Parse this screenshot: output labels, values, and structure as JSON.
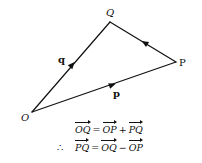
{
  "diagram": {
    "points": {
      "O": {
        "label": "O",
        "x": 32,
        "y": 112
      },
      "Q": {
        "label": "Q",
        "x": 110,
        "y": 22
      },
      "P": {
        "label": "P",
        "x": 176,
        "y": 62
      }
    },
    "vectors": [
      {
        "from": "O",
        "to": "Q",
        "label": "q"
      },
      {
        "from": "O",
        "to": "P",
        "label": "p"
      },
      {
        "from": "P",
        "to": "Q",
        "label": ""
      }
    ],
    "stroke_color": "#111111"
  },
  "equations": {
    "line1": {
      "lhs": "OQ",
      "eq": "=",
      "t1": "OP",
      "op": "+",
      "t2": "PQ"
    },
    "line2": {
      "prefix": "∴",
      "lhs": "PQ",
      "eq": "=",
      "t1": "OQ",
      "op": "−",
      "t2": "OP"
    }
  }
}
